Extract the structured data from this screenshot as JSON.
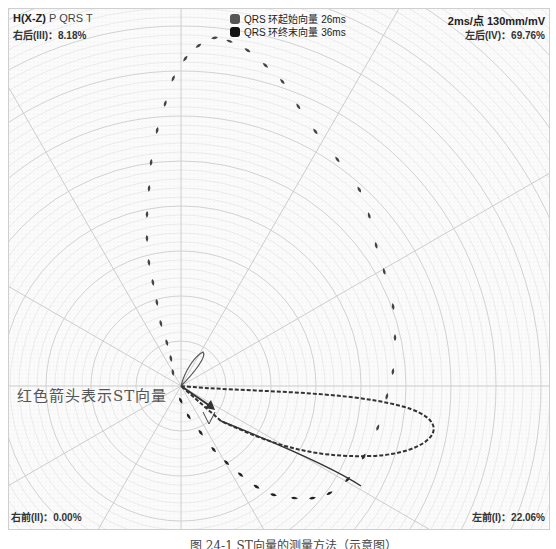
{
  "header": {
    "title": "H(X-Z)",
    "waves": "P QRS T",
    "quadrant_right_posterior": "右后(III)：8.18%",
    "scale": "2ms/点 130mm/mV",
    "quadrant_left_posterior": "左后(IV)：69.76%"
  },
  "legend": {
    "items": [
      {
        "label": "QRS 环起始向量 26ms",
        "color": "#555555"
      },
      {
        "label": "QRS 环终末向量 36ms",
        "color": "#111111"
      }
    ]
  },
  "footer": {
    "quadrant_right_anterior": "右前(II)：0.00%",
    "quadrant_left_anterior": "左前(I)：22.06%",
    "caption": "图 24-1  ST向量的测量方法（示意图）"
  },
  "annotation": {
    "st_note": "红色箭头表示ST向量"
  },
  "colors": {
    "grid_line": "#d9d9d9",
    "axis_line": "#c8c8c8",
    "qrs_marker": "#444444",
    "loop_line": "#333333"
  },
  "chart_data": {
    "type": "polar-vectorcardiogram",
    "title": "H(X-Z) P QRS T",
    "plane": "Horizontal (X-Z)",
    "scale": "2ms/点 130mm/mV",
    "origin_px": [
      180,
      385
    ],
    "radial_lines_deg": [
      0,
      30,
      60,
      90,
      120,
      150,
      180,
      210,
      240,
      270,
      300,
      330
    ],
    "quadrants": [
      {
        "name": "左前(I)",
        "percent": 22.06
      },
      {
        "name": "右前(II)",
        "percent": 0.0
      },
      {
        "name": "右后(III)",
        "percent": 8.18
      },
      {
        "name": "左后(IV)",
        "percent": 69.76
      }
    ],
    "legend": [
      "QRS 环起始向量 26ms",
      "QRS 环终末向量 36ms"
    ],
    "loops": [
      {
        "name": "QRS loop",
        "style": "teardrop markers (2ms/点)",
        "direction": "counter-clockwise large loop, posterior-left"
      },
      {
        "name": "T loop",
        "style": "dashed",
        "direction": "elongated to left-anterior"
      },
      {
        "name": "P loop",
        "style": "small solid",
        "direction": "small posterior-left"
      },
      {
        "name": "ST vector",
        "style": "arrow",
        "direction": "left-anterior"
      }
    ],
    "annotation": "红色箭头表示ST向量"
  }
}
